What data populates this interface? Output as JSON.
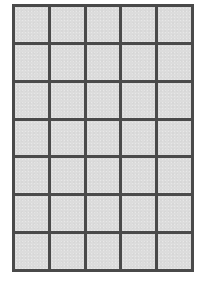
{
  "diagram": {
    "type": "grid",
    "rows": 7,
    "columns": 5,
    "cell_fill_color": "#dcdcdc",
    "line_color": "#4a4a4a",
    "background_color": "#ffffff"
  }
}
